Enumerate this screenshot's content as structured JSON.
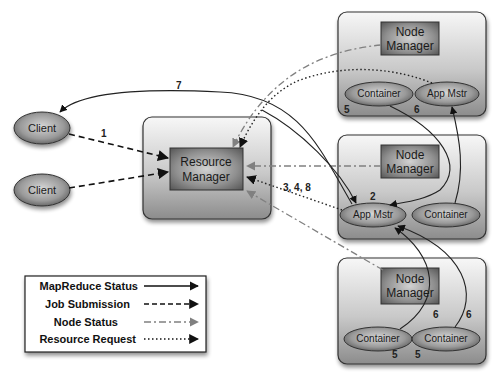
{
  "diagram": {
    "nodes": {
      "client1": {
        "label": "Client"
      },
      "client2": {
        "label": "Client"
      },
      "resource_manager": {
        "line1": "Resource",
        "line2": "Manager"
      },
      "node_manager_1": {
        "line1": "Node",
        "line2": "Manager",
        "container": "Container",
        "app_master": "App Mstr",
        "container_step": "5",
        "app_master_step": "6"
      },
      "node_manager_2": {
        "line1": "Node",
        "line2": "Manager",
        "app_master": "App Mstr",
        "container": "Container",
        "app_master_step": "2"
      },
      "node_manager_3": {
        "line1": "Node",
        "line2": "Manager",
        "container_a": "Container",
        "container_b": "Container",
        "container_a_step": "5",
        "container_b_step": "5",
        "edge_a_step": "6",
        "edge_b_step": "6"
      }
    },
    "edge_labels": {
      "client_to_rm": "1",
      "am_to_client": "7",
      "am_to_rm": "3, 4, 8"
    },
    "legend": {
      "items": [
        {
          "label": "MapReduce Status",
          "style": "solid"
        },
        {
          "label": "Job Submission",
          "style": "dashed"
        },
        {
          "label": "Node Status",
          "style": "dash-dot"
        },
        {
          "label": "Resource Request",
          "style": "dotted"
        }
      ]
    },
    "colors": {
      "box_border": "#3a3a3a",
      "panel_top": "#f4f4f4",
      "panel_bottom": "#8a8a8a",
      "inner_box_light": "#bdbdbd",
      "inner_box_dark": "#5c5c5c",
      "node_status_line": "#7a7a7a",
      "line_dark": "#222222"
    }
  }
}
